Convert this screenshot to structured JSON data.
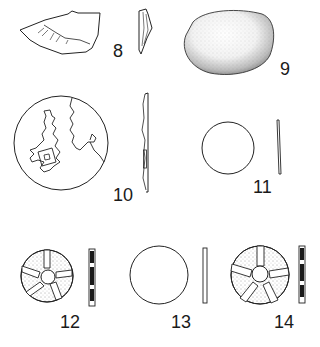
{
  "figure": {
    "stroke_color": "#222222",
    "fill_dark": "#1a1a1a",
    "items": [
      {
        "id": "8",
        "label": "8",
        "description": "flint flake, plan and side profile"
      },
      {
        "id": "9",
        "label": "9",
        "description": "stippled pebble"
      },
      {
        "id": "10",
        "label": "10",
        "description": "disc engraved with map, plan and side profile"
      },
      {
        "id": "11",
        "label": "11",
        "description": "plain disc, plan and side profile"
      },
      {
        "id": "12",
        "label": "12",
        "description": "disc with five-spoke pattern and side profile"
      },
      {
        "id": "13",
        "label": "13",
        "description": "plain disc, plan and side profile"
      },
      {
        "id": "14",
        "label": "14",
        "description": "disc with five-spoke pattern and side profile"
      }
    ]
  }
}
